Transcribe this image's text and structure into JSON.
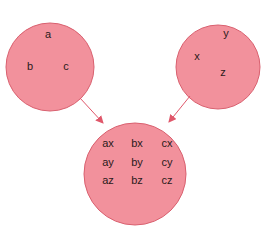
{
  "colors": {
    "circle_fill": "#f2919c",
    "circle_stroke": "#d9606f",
    "arrow": "#e0576a"
  },
  "set_a": {
    "elements": [
      "a",
      "b",
      "c"
    ]
  },
  "set_b": {
    "elements": [
      "x",
      "y",
      "z"
    ]
  },
  "product": {
    "rows": [
      [
        "ax",
        "bx",
        "cx"
      ],
      [
        "ay",
        "by",
        "cy"
      ],
      [
        "az",
        "bz",
        "cz"
      ]
    ]
  }
}
